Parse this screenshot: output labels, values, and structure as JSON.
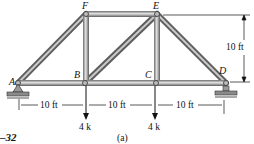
{
  "diagram": {
    "figure_number": "–32",
    "figure_part": "(a)",
    "joints": [
      {
        "id": "A",
        "label": "A",
        "x": 18,
        "y": 83
      },
      {
        "id": "B",
        "label": "B",
        "x": 85,
        "y": 83
      },
      {
        "id": "C",
        "label": "C",
        "x": 156,
        "y": 83
      },
      {
        "id": "D",
        "label": "D",
        "x": 226,
        "y": 83
      },
      {
        "id": "E",
        "label": "E",
        "x": 157,
        "y": 14
      },
      {
        "id": "F",
        "label": "F",
        "x": 86,
        "y": 14
      }
    ],
    "members": [
      [
        "A",
        "B"
      ],
      [
        "B",
        "C"
      ],
      [
        "C",
        "D"
      ],
      [
        "F",
        "E"
      ],
      [
        "A",
        "F"
      ],
      [
        "B",
        "F"
      ],
      [
        "B",
        "E"
      ],
      [
        "C",
        "E"
      ],
      [
        "E",
        "D"
      ]
    ],
    "loads": [
      {
        "joint": "B",
        "label": "4 k",
        "direction": "down"
      },
      {
        "joint": "C",
        "label": "4 k",
        "direction": "down"
      }
    ],
    "supports": [
      {
        "joint": "A",
        "type": "pin"
      },
      {
        "joint": "D",
        "type": "roller"
      }
    ],
    "dimensions": {
      "horizontal": [
        "10 ft",
        "10 ft",
        "10 ft"
      ],
      "vertical": "10 ft"
    },
    "colors": {
      "member": "#8a8a8a",
      "member_highlight": "#d8d8d8",
      "ink": "#111111"
    }
  }
}
